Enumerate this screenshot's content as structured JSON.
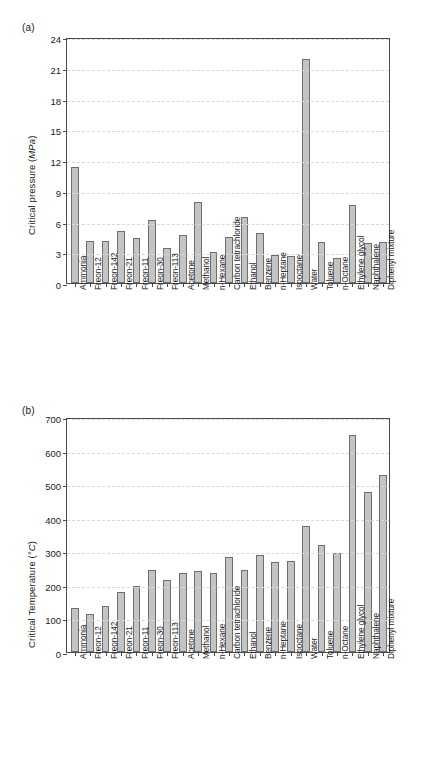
{
  "figure": {
    "panel_a_label": "(a)",
    "panel_b_label": "(b)"
  },
  "chart_data": [
    {
      "type": "bar",
      "panel": "(a)",
      "title": "",
      "xlabel": "",
      "ylabel": "Critical pressure (MPa)",
      "ylabel_plain": "Critical pressure",
      "ylabel_unit": "MPa",
      "ylim": [
        0,
        24
      ],
      "yticks": [
        0,
        3,
        6,
        9,
        12,
        15,
        18,
        21,
        24
      ],
      "ytick_labels": [
        "0",
        "3",
        "6",
        "9",
        "12",
        "15",
        "18",
        "21",
        "24"
      ],
      "grid": true,
      "legend": "none",
      "categories": [
        "Ammonia",
        "Freon-12",
        "Freon-142",
        "Freon-21",
        "Freon-11",
        "Freon-30",
        "Freon-113",
        "Acetone",
        "Methanol",
        "n-Hexane",
        "Carbon tetrachloride",
        "Ethanol",
        "Benzene",
        "n-Heptane",
        "Isooctane",
        "Water",
        "Toluene",
        "n-Octane",
        "Ethylene glycol",
        "Naphthalene",
        "Diphenyl mixture"
      ],
      "values": [
        11.3,
        4.1,
        4.1,
        5.1,
        4.4,
        6.1,
        3.4,
        4.7,
        7.9,
        3.0,
        4.5,
        6.4,
        4.9,
        2.7,
        2.6,
        21.9,
        4.0,
        2.4,
        7.6,
        3.9,
        4.0
      ]
    },
    {
      "type": "bar",
      "panel": "(b)",
      "title": "",
      "xlabel": "",
      "ylabel": "Critical Temperature (°C)",
      "ylabel_plain": "Critical Temperature",
      "ylabel_unit": "°C",
      "ylim": [
        0,
        700
      ],
      "yticks": [
        0,
        100,
        200,
        300,
        400,
        500,
        600,
        700
      ],
      "ytick_labels": [
        "0",
        "100",
        "200",
        "300",
        "400",
        "500",
        "600",
        "700"
      ],
      "grid": true,
      "legend": "none",
      "categories": [
        "Ammonia",
        "Freon-12",
        "Freon-142",
        "Freon-21",
        "Freon-11",
        "Freon-30",
        "Freon-113",
        "Acetone",
        "Methanol",
        "n-Hexane",
        "Carbon tetrachloride",
        "Ethanol",
        "Benzene",
        "n-Heptane",
        "Isooctane",
        "Water",
        "Toluene",
        "n-Octane",
        "Ethylene glycol",
        "Naphthalene",
        "Diphenyl mixture"
      ],
      "values": [
        132,
        112,
        137,
        178,
        198,
        245,
        214,
        235,
        240,
        234,
        283,
        243,
        289,
        267,
        271,
        374,
        319,
        296,
        645,
        478,
        528
      ]
    }
  ]
}
